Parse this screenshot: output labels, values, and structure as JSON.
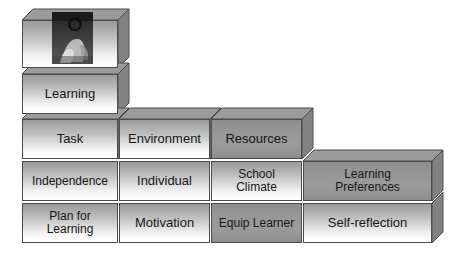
{
  "diagram": {
    "colors": {
      "front_light_top": "#9a9a9a",
      "front_light_bottom": "#ffffff",
      "front_mid_gray": "#969696",
      "top_face": "#9e9e9e",
      "side_face": "#858585",
      "outline": "#4c4c4c",
      "text": "#171717",
      "background": "#ffffff"
    },
    "rows": [
      {
        "row": 1,
        "blocks": [
          {
            "id": "photo-block",
            "label": "",
            "shade": "light",
            "has_photo": true,
            "photo_alt": "grayscale photograph of a child"
          }
        ]
      },
      {
        "row": 2,
        "blocks": [
          {
            "id": "learning",
            "label": "Learning",
            "shade": "light",
            "lines": [
              "Learning"
            ]
          }
        ]
      },
      {
        "row": 3,
        "blocks": [
          {
            "id": "task",
            "label": "Task",
            "shade": "light",
            "lines": [
              "Task"
            ]
          },
          {
            "id": "environment",
            "label": "Environment",
            "shade": "light",
            "lines": [
              "Environment"
            ]
          },
          {
            "id": "resources",
            "label": "Resources",
            "shade": "dark",
            "lines": [
              "Resources"
            ]
          }
        ]
      },
      {
        "row": 4,
        "blocks": [
          {
            "id": "independence",
            "label": "Independence",
            "shade": "light",
            "lines": [
              "Independence"
            ]
          },
          {
            "id": "individual",
            "label": "Individual",
            "shade": "light",
            "lines": [
              "Individual"
            ]
          },
          {
            "id": "school-climate",
            "label": "School Climate",
            "shade": "light",
            "lines": [
              "School",
              "Climate"
            ]
          },
          {
            "id": "learning-preferences",
            "label": "Learning Preferences",
            "shade": "dark",
            "lines": [
              "Learning",
              "Preferences"
            ]
          }
        ]
      },
      {
        "row": 5,
        "blocks": [
          {
            "id": "plan-for-learning",
            "label": "Plan for Learning",
            "shade": "light",
            "lines": [
              "Plan for",
              "Learning"
            ]
          },
          {
            "id": "motivation",
            "label": "Motivation",
            "shade": "light",
            "lines": [
              "Motivation"
            ]
          },
          {
            "id": "equip-learner",
            "label": "Equip Learner",
            "shade": "dark",
            "lines": [
              "Equip Learner"
            ]
          },
          {
            "id": "self-reflection",
            "label": "Self-reflection",
            "shade": "light",
            "lines": [
              "Self-reflection"
            ]
          }
        ]
      }
    ]
  },
  "labels": {
    "learning": "Learning",
    "task": "Task",
    "environment": "Environment",
    "resources": "Resources",
    "independence": "Independence",
    "individual": "Individual",
    "school_climate_1": "School",
    "school_climate_2": "Climate",
    "learning_preferences_1": "Learning",
    "learning_preferences_2": "Preferences",
    "plan_for_learning_1": "Plan for",
    "plan_for_learning_2": "Learning",
    "motivation": "Motivation",
    "equip_learner": "Equip Learner",
    "self_reflection": "Self-reflection"
  }
}
